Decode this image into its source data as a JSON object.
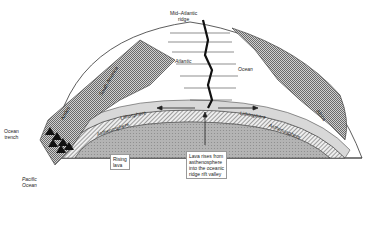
{
  "diagram": {
    "title": "",
    "labels": {
      "ridge": [
        "Mid–Atlantic",
        "ridge"
      ],
      "atlantic": "Atlantic",
      "ocean": "Ocean",
      "south_america": "South America",
      "andes": "Andes",
      "africa": "Africa",
      "lithosphere_left": "Lithosphere",
      "lithosphere_right": "Lithosphere",
      "asthenosphere_left": "Asthenosphere",
      "asthenosphere_right": "Asthenosphere",
      "ocean_trench": [
        "Ocean",
        "trench"
      ],
      "rising_lava": [
        "Rising",
        "lava"
      ],
      "lava_rises": [
        "Lava rises from",
        "asthenosphere",
        "into the oceanic",
        "ridge rift valley"
      ],
      "pacific": [
        "Pacific",
        "Ocean"
      ]
    },
    "colors": {
      "mantle": "#a8a8a8",
      "continent": "#9a9a9a",
      "lithosphere": "#d8d8d8",
      "outline": "#333333"
    }
  }
}
